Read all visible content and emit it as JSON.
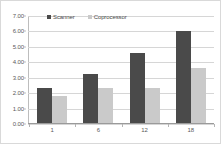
{
  "chart_data": {
    "type": "bar",
    "title": "",
    "subtitle": "",
    "xlabel": "",
    "ylabel": "",
    "categories": [
      "1",
      "6",
      "12",
      "18"
    ],
    "series": [
      {
        "name": "Scanner",
        "color": "#4a4a4a",
        "values": [
          2.3,
          3.2,
          4.55,
          5.95
        ]
      },
      {
        "name": "Coprocessor",
        "color": "#cacaca",
        "values": [
          1.75,
          2.25,
          2.25,
          3.55
        ]
      }
    ],
    "ylim": [
      0.0,
      7.0
    ],
    "ytick_step": 1.0,
    "ytick_labels": [
      "7.00",
      "6.00",
      "5.00",
      "4.00",
      "3.00",
      "2.00",
      "1.00",
      "0.00"
    ],
    "ytick_values": [
      7.0,
      6.0,
      5.0,
      4.0,
      3.0,
      2.0,
      1.0,
      0.0
    ],
    "grid": true,
    "grid_axis": "y",
    "legend_position": "top-left-inside",
    "annotations": []
  },
  "legend": {
    "items": [
      {
        "label": "Scanner"
      },
      {
        "label": "Coprocessor"
      }
    ]
  }
}
